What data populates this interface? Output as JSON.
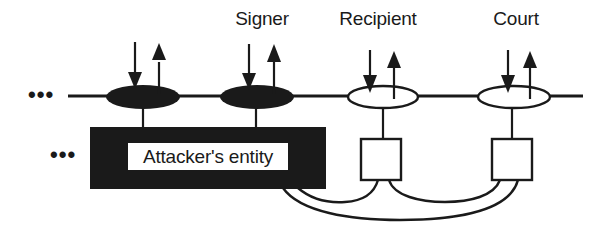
{
  "diagram": {
    "nodes": [
      {
        "id": "attacker-node-1",
        "style": "filled",
        "label": ""
      },
      {
        "id": "signer",
        "style": "filled",
        "label": "Signer"
      },
      {
        "id": "recipient",
        "style": "hollow",
        "label": "Recipient"
      },
      {
        "id": "court",
        "style": "hollow",
        "label": "Court"
      }
    ],
    "top_ellipsis": "•••",
    "bottom_ellipsis": "•••",
    "attacker_entity_label": "Attacker's entity",
    "colors": {
      "ink": "#1a1a1a",
      "background": "#ffffff"
    }
  }
}
